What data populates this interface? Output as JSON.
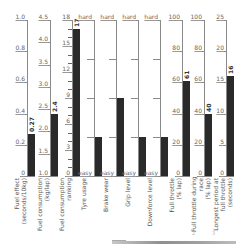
{
  "chart_data": {
    "type": "bar",
    "title": "",
    "layout": "multi-axis vertical gauge bars, one independent axis per column",
    "grid": false,
    "legend": null,
    "columns": [
      {
        "label": "Fuel effect (seconds/10kg)",
        "label_lines": [
          "Fuel effect",
          "(seconds/10kg)"
        ],
        "ylim": [
          0,
          1.0
        ],
        "ticks": [
          "0",
          "0.2",
          "0.4",
          "0.6",
          "0.8",
          "1.0"
        ],
        "minor_ticks": 0,
        "value": 0.27,
        "value_label": "0.27"
      },
      {
        "label": "Fuel consumption (kg/lap)",
        "label_lines": [
          "Fuel consumption",
          "(kg/lap)"
        ],
        "ylim": [
          1.0,
          4.5
        ],
        "ticks": [
          "1.0",
          "1.5",
          "2.0",
          "2.5",
          "3.0",
          "3.5",
          "4.0",
          "4.5"
        ],
        "minor_ticks": 0,
        "value": 2.4,
        "value_label": "2.4"
      },
      {
        "label": "Fuel consumption ranking",
        "label_lines": [
          "Fuel consumption",
          "ranking"
        ],
        "ylim": [
          0,
          18
        ],
        "ticks": [
          "0",
          "3",
          "6",
          "9",
          "12",
          "15",
          "18"
        ],
        "minor_ticks": 2,
        "value": 17,
        "value_label": "17"
      },
      {
        "label": "Tyre usage",
        "label_lines": [
          "Tyre usage"
        ],
        "ylim": [
          0,
          4
        ],
        "ticks": [
          "easy",
          "",
          "",
          "",
          "hard"
        ],
        "minor_ticks": 0,
        "value": 1,
        "value_label": ""
      },
      {
        "label": "Brake wear",
        "label_lines": [
          "Brake wear"
        ],
        "ylim": [
          0,
          4
        ],
        "ticks": [
          "easy",
          "",
          "",
          "",
          "hard"
        ],
        "minor_ticks": 0,
        "value": 2,
        "value_label": ""
      },
      {
        "label": "Grip level",
        "label_lines": [
          "Grip level"
        ],
        "ylim": [
          0,
          4
        ],
        "ticks": [
          "easy",
          "",
          "",
          "",
          "hard"
        ],
        "minor_ticks": 0,
        "value": 1,
        "value_label": ""
      },
      {
        "label": "Downforce level",
        "label_lines": [
          "Downforce level"
        ],
        "ylim": [
          0,
          4
        ],
        "ticks": [
          "easy",
          "",
          "",
          "",
          "hard"
        ],
        "minor_ticks": 0,
        "value": 1,
        "value_label": ""
      },
      {
        "label": "Full throttle (% lap)",
        "label_lines": [
          "Full throttle",
          "(% lap)"
        ],
        "ylim": [
          0,
          100
        ],
        "ticks": [
          "0",
          "20",
          "40",
          "60",
          "80",
          "100"
        ],
        "minor_ticks": 0,
        "value": 61,
        "value_label": "61"
      },
      {
        "label": "Full throttle during race (% lap)",
        "label_lines": [
          "Full throttle during",
          "race",
          "(% lap)"
        ],
        "ylim": [
          0,
          100
        ],
        "ticks": [
          "0",
          "20",
          "40",
          "60",
          "80",
          "100"
        ],
        "minor_ticks": 0,
        "value": 40,
        "value_label": "40"
      },
      {
        "label": "Longest period at full throttle (seconds)",
        "label_lines": [
          "Longest period at",
          "full throttle",
          "(seconds)"
        ],
        "ylim": [
          0,
          25
        ],
        "ticks": [
          "0",
          "5",
          "10",
          "15",
          "20",
          "25"
        ],
        "minor_ticks": 0,
        "value": 16,
        "value_label": "16"
      }
    ]
  },
  "colors": {
    "bar": "#2a2a2a",
    "axis": "#8a8a8a",
    "text": "#555555"
  },
  "footer": {
    "marks": [
      "2",
      "3"
    ]
  }
}
